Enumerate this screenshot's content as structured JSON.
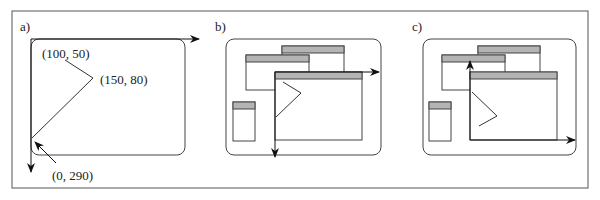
{
  "panels": {
    "a": {
      "label": "a)",
      "points": [
        {
          "text": "(100, 50)"
        },
        {
          "text": "(150, 80)"
        },
        {
          "text": "(0, 290)"
        }
      ]
    },
    "b": {
      "label": "b)"
    },
    "c": {
      "label": "c)"
    }
  },
  "colors": {
    "stroke": "#333333",
    "titlebar": "#b4b4b4",
    "background": "#ffffff"
  }
}
